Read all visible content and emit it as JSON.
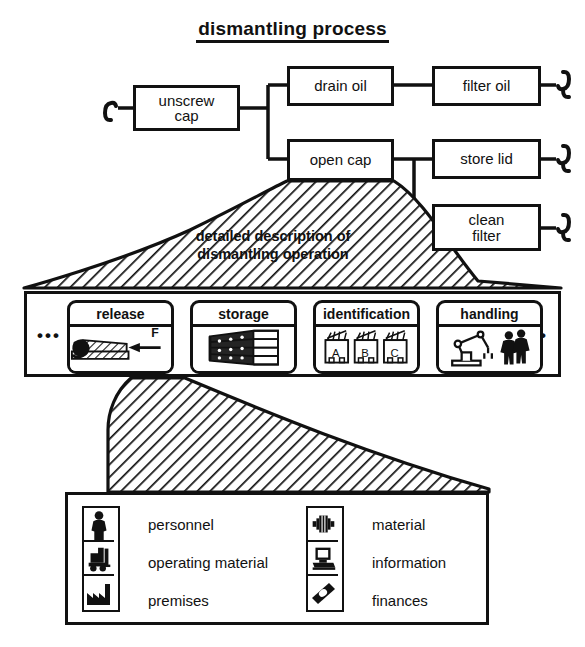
{
  "title": "dismantling process",
  "flow": {
    "nodes": [
      {
        "id": "unscrew-cap",
        "label": "unscrew\ncap"
      },
      {
        "id": "drain-oil",
        "label": "drain oil"
      },
      {
        "id": "filter-oil",
        "label": "filter oil"
      },
      {
        "id": "open-cap",
        "label": "open cap"
      },
      {
        "id": "store-lid",
        "label": "store lid"
      },
      {
        "id": "clean-filter",
        "label": "clean\nfilter"
      }
    ],
    "continuation_symbol": "∫"
  },
  "funnel_top": {
    "line1": "detailed description of",
    "line2": "dismantling operation"
  },
  "cards": {
    "left_ellipsis": "•••",
    "right_ellipsis": "•••",
    "items": [
      {
        "title": "release",
        "icon": "wedge-force-icon",
        "annotation": "F"
      },
      {
        "title": "storage",
        "icon": "shelf-rack-icon",
        "annotation": ""
      },
      {
        "title": "identification",
        "icon": "labelled-containers-icon",
        "annotation": "A B C"
      },
      {
        "title": "handling",
        "icon": "robot-arm-workers-icon",
        "annotation": ""
      }
    ],
    "identification_labels": [
      "A",
      "B",
      "C"
    ]
  },
  "legend": {
    "left": [
      {
        "label": "personnel",
        "icon": "person-icon"
      },
      {
        "label": "operating material",
        "icon": "forklift-icon"
      },
      {
        "label": "premises",
        "icon": "factory-icon"
      }
    ],
    "right": [
      {
        "label": "material",
        "icon": "machine-part-icon"
      },
      {
        "label": "information",
        "icon": "computer-icon"
      },
      {
        "label": "finances",
        "icon": "banknote-icon"
      }
    ]
  },
  "colors": {
    "ink": "#111111",
    "paper": "#ffffff",
    "hatch": "#111111"
  }
}
